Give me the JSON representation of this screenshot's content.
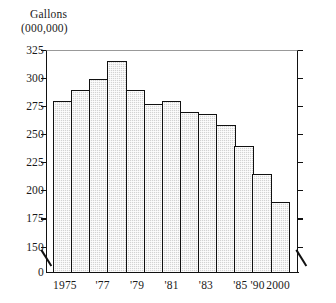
{
  "chart_data": {
    "type": "bar",
    "title": "",
    "subtitle": "",
    "ylabel_line1": "Gallons",
    "ylabel_line2": "(000,000)",
    "xlabel": "",
    "categories": [
      "1975",
      "",
      "'77",
      "",
      "'79",
      "",
      "'81",
      "",
      "'83",
      "",
      "'85",
      "'90",
      "2000"
    ],
    "tick_labels_x": [
      "1975",
      "",
      "'77",
      "",
      "'79",
      "",
      "'81",
      "",
      "'83",
      "",
      "'85",
      "'90",
      "2000"
    ],
    "bar_labels": [
      "1975",
      "1976",
      "'77",
      "1978",
      "'79",
      "1980",
      "'81",
      "1982",
      "'83",
      "1984",
      "'85",
      "'90",
      "2000"
    ],
    "values": [
      281,
      290,
      300,
      316,
      290,
      278,
      281,
      271,
      269,
      259,
      241,
      216,
      191
    ],
    "ylim": [
      0,
      325
    ],
    "y_axis_break": true,
    "y_break_between": [
      0,
      150
    ],
    "ytick_labels": [
      "325",
      "300",
      "275",
      "250",
      "225",
      "200",
      "175",
      "150",
      "0"
    ],
    "ytick_values": [
      325,
      300,
      275,
      250,
      225,
      200,
      175,
      150,
      0
    ],
    "grid": false,
    "legend": null,
    "legend_position": "none",
    "bar_fill_color": "#d3d3d3",
    "bar_edge_color": "#111111",
    "axis_color": "#111111",
    "background_color": "#ffffff"
  }
}
